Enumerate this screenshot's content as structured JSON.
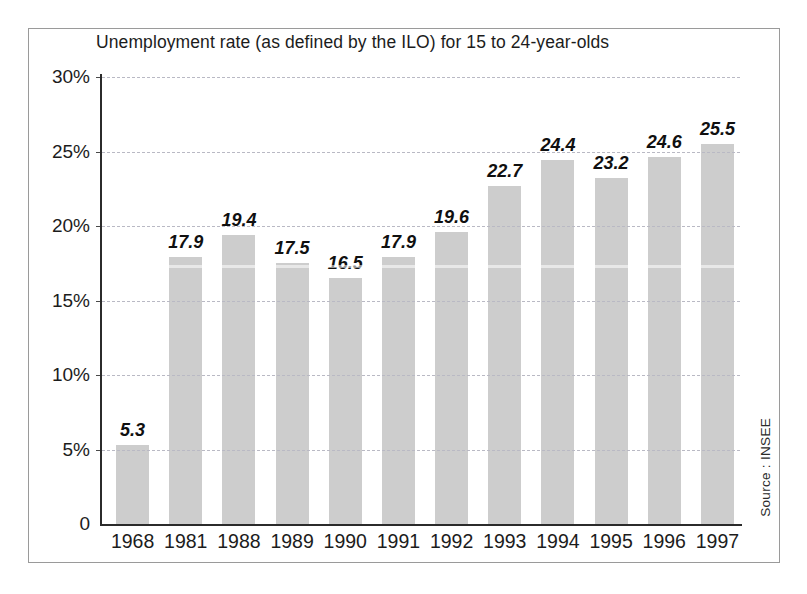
{
  "frame": {
    "border_color": "#9a9a9a",
    "background": "#ffffff"
  },
  "source_note": "Source : INSEE",
  "chart_data": {
    "type": "bar",
    "title": "Unemployment rate (as defined by the ILO) for 15 to 24-year-olds",
    "xlabel": "",
    "ylabel": "",
    "categories": [
      "1968",
      "1981",
      "1988",
      "1989",
      "1990",
      "1991",
      "1992",
      "1993",
      "1994",
      "1995",
      "1996",
      "1997"
    ],
    "values": [
      5.3,
      17.9,
      19.4,
      17.5,
      16.5,
      17.9,
      19.6,
      22.7,
      24.4,
      23.2,
      24.6,
      25.5
    ],
    "value_labels": [
      "5.3",
      "17.9",
      "19.4",
      "17.5",
      "16.5",
      "17.9",
      "19.6",
      "22.7",
      "24.4",
      "23.2",
      "24.6",
      "25.5"
    ],
    "ylim": [
      0,
      30
    ],
    "yticks": [
      0,
      5,
      10,
      15,
      20,
      25,
      30
    ],
    "ytick_labels": [
      "0",
      "5%",
      "10%",
      "15%",
      "20%",
      "25%",
      "30%"
    ],
    "grid": true,
    "grid_style": "dashed",
    "grid_color": "#b9b9c4",
    "legend": false,
    "bar_color": "#cdcdcd",
    "axis_color": "#2b2b2b",
    "units": "percent"
  }
}
